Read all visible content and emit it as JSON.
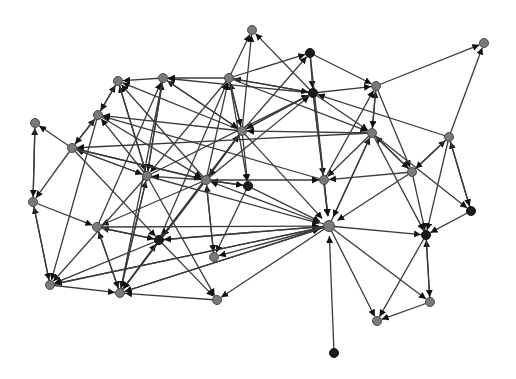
{
  "diagram": {
    "type": "directed-network-graph",
    "colors": {
      "edge": "#3a3a3a",
      "arrowhead": "#111111",
      "node_gray": "#7a7a7a",
      "node_dark": "#1c1c1c",
      "background": "#ffffff"
    },
    "nodes": [
      {
        "id": "n1",
        "x": 252,
        "y": 30,
        "kind": "gray"
      },
      {
        "id": "n2",
        "x": 484,
        "y": 43,
        "kind": "gray"
      },
      {
        "id": "n3",
        "x": 310,
        "y": 53,
        "kind": "dark"
      },
      {
        "id": "n4",
        "x": 118,
        "y": 81,
        "kind": "gray"
      },
      {
        "id": "n5",
        "x": 163,
        "y": 78,
        "kind": "gray"
      },
      {
        "id": "n6",
        "x": 229,
        "y": 78,
        "kind": "gray"
      },
      {
        "id": "n7",
        "x": 376,
        "y": 86,
        "kind": "gray"
      },
      {
        "id": "n8",
        "x": 313,
        "y": 93,
        "kind": "dark"
      },
      {
        "id": "n9",
        "x": 35,
        "y": 123,
        "kind": "gray"
      },
      {
        "id": "n10",
        "x": 98,
        "y": 115,
        "kind": "gray"
      },
      {
        "id": "n11",
        "x": 72,
        "y": 148,
        "kind": "gray"
      },
      {
        "id": "n12",
        "x": 242,
        "y": 131,
        "kind": "gray"
      },
      {
        "id": "n13",
        "x": 372,
        "y": 133,
        "kind": "gray"
      },
      {
        "id": "n14",
        "x": 449,
        "y": 137,
        "kind": "gray"
      },
      {
        "id": "n15",
        "x": 147,
        "y": 176,
        "kind": "gray"
      },
      {
        "id": "n16",
        "x": 206,
        "y": 180,
        "kind": "gray"
      },
      {
        "id": "n17",
        "x": 248,
        "y": 186,
        "kind": "dark"
      },
      {
        "id": "n18",
        "x": 324,
        "y": 180,
        "kind": "gray"
      },
      {
        "id": "n19",
        "x": 412,
        "y": 172,
        "kind": "gray"
      },
      {
        "id": "n20",
        "x": 33,
        "y": 202,
        "kind": "gray"
      },
      {
        "id": "n21",
        "x": 471,
        "y": 211,
        "kind": "dark"
      },
      {
        "id": "n22",
        "x": 97,
        "y": 227,
        "kind": "gray"
      },
      {
        "id": "n23",
        "x": 329,
        "y": 226,
        "kind": "gray",
        "hub": true
      },
      {
        "id": "n24",
        "x": 426,
        "y": 235,
        "kind": "dark"
      },
      {
        "id": "n25",
        "x": 159,
        "y": 240,
        "kind": "dark"
      },
      {
        "id": "n26",
        "x": 214,
        "y": 257,
        "kind": "gray"
      },
      {
        "id": "n27",
        "x": 50,
        "y": 285,
        "kind": "gray"
      },
      {
        "id": "n28",
        "x": 120,
        "y": 293,
        "kind": "gray"
      },
      {
        "id": "n29",
        "x": 217,
        "y": 300,
        "kind": "gray"
      },
      {
        "id": "n30",
        "x": 430,
        "y": 302,
        "kind": "gray"
      },
      {
        "id": "n31",
        "x": 377,
        "y": 321,
        "kind": "gray"
      },
      {
        "id": "n32",
        "x": 334,
        "y": 353,
        "kind": "dark"
      }
    ],
    "edges": [
      [
        "n6",
        "n1"
      ],
      [
        "n8",
        "n1"
      ],
      [
        "n12",
        "n1"
      ],
      [
        "n7",
        "n2"
      ],
      [
        "n14",
        "n2"
      ],
      [
        "n6",
        "n3"
      ],
      [
        "n12",
        "n3"
      ],
      [
        "n3",
        "n7"
      ],
      [
        "n3",
        "n8"
      ],
      [
        "n10",
        "n4"
      ],
      [
        "n5",
        "n4"
      ],
      [
        "n15",
        "n4"
      ],
      [
        "n16",
        "n4"
      ],
      [
        "n12",
        "n4"
      ],
      [
        "n6",
        "n5"
      ],
      [
        "n8",
        "n5"
      ],
      [
        "n15",
        "n5"
      ],
      [
        "n22",
        "n5"
      ],
      [
        "n12",
        "n5"
      ],
      [
        "n12",
        "n6"
      ],
      [
        "n16",
        "n6"
      ],
      [
        "n8",
        "n6"
      ],
      [
        "n25",
        "n6"
      ],
      [
        "n13",
        "n7"
      ],
      [
        "n8",
        "n7"
      ],
      [
        "n18",
        "n7"
      ],
      [
        "n6",
        "n8"
      ],
      [
        "n15",
        "n8"
      ],
      [
        "n16",
        "n8"
      ],
      [
        "n12",
        "n8"
      ],
      [
        "n14",
        "n8"
      ],
      [
        "n20",
        "n9"
      ],
      [
        "n11",
        "n9"
      ],
      [
        "n4",
        "n10"
      ],
      [
        "n11",
        "n10"
      ],
      [
        "n15",
        "n10"
      ],
      [
        "n12",
        "n10"
      ],
      [
        "n18",
        "n10"
      ],
      [
        "n10",
        "n11"
      ],
      [
        "n16",
        "n11"
      ],
      [
        "n13",
        "n11"
      ],
      [
        "n15",
        "n11"
      ],
      [
        "n8",
        "n12"
      ],
      [
        "n13",
        "n12"
      ],
      [
        "n6",
        "n12"
      ],
      [
        "n16",
        "n12"
      ],
      [
        "n5",
        "n12"
      ],
      [
        "n7",
        "n13"
      ],
      [
        "n8",
        "n13"
      ],
      [
        "n19",
        "n13"
      ],
      [
        "n23",
        "n13"
      ],
      [
        "n6",
        "n13"
      ],
      [
        "n19",
        "n14"
      ],
      [
        "n21",
        "n14"
      ],
      [
        "n5",
        "n15"
      ],
      [
        "n4",
        "n15"
      ],
      [
        "n11",
        "n15"
      ],
      [
        "n16",
        "n15"
      ],
      [
        "n28",
        "n15"
      ],
      [
        "n6",
        "n15"
      ],
      [
        "n11",
        "n16"
      ],
      [
        "n10",
        "n16"
      ],
      [
        "n12",
        "n16"
      ],
      [
        "n23",
        "n16"
      ],
      [
        "n26",
        "n16"
      ],
      [
        "n17",
        "n16"
      ],
      [
        "n12",
        "n17"
      ],
      [
        "n16",
        "n17"
      ],
      [
        "n6",
        "n17"
      ],
      [
        "n13",
        "n18"
      ],
      [
        "n8",
        "n18"
      ],
      [
        "n16",
        "n18"
      ],
      [
        "n19",
        "n18"
      ],
      [
        "n13",
        "n19"
      ],
      [
        "n7",
        "n19"
      ],
      [
        "n14",
        "n19"
      ],
      [
        "n9",
        "n20"
      ],
      [
        "n11",
        "n20"
      ],
      [
        "n27",
        "n20"
      ],
      [
        "n14",
        "n21"
      ],
      [
        "n13",
        "n21"
      ],
      [
        "n20",
        "n22"
      ],
      [
        "n25",
        "n22"
      ],
      [
        "n28",
        "n22"
      ],
      [
        "n16",
        "n22"
      ],
      [
        "n12",
        "n23"
      ],
      [
        "n15",
        "n23"
      ],
      [
        "n25",
        "n23"
      ],
      [
        "n22",
        "n23"
      ],
      [
        "n18",
        "n23"
      ],
      [
        "n8",
        "n23"
      ],
      [
        "n19",
        "n23"
      ],
      [
        "n13",
        "n23"
      ],
      [
        "n27",
        "n23"
      ],
      [
        "n17",
        "n23"
      ],
      [
        "n28",
        "n23"
      ],
      [
        "n3",
        "n23"
      ],
      [
        "n13",
        "n24"
      ],
      [
        "n23",
        "n24"
      ],
      [
        "n21",
        "n24"
      ],
      [
        "n19",
        "n24"
      ],
      [
        "n30",
        "n24"
      ],
      [
        "n14",
        "n24"
      ],
      [
        "n11",
        "n25"
      ],
      [
        "n22",
        "n25"
      ],
      [
        "n28",
        "n25"
      ],
      [
        "n16",
        "n25"
      ],
      [
        "n23",
        "n25"
      ],
      [
        "n12",
        "n25"
      ],
      [
        "n17",
        "n26"
      ],
      [
        "n16",
        "n26"
      ],
      [
        "n23",
        "n26"
      ],
      [
        "n20",
        "n27"
      ],
      [
        "n10",
        "n27"
      ],
      [
        "n15",
        "n27"
      ],
      [
        "n25",
        "n27"
      ],
      [
        "n23",
        "n27"
      ],
      [
        "n27",
        "n28"
      ],
      [
        "n22",
        "n28"
      ],
      [
        "n15",
        "n28"
      ],
      [
        "n16",
        "n28"
      ],
      [
        "n5",
        "n28"
      ],
      [
        "n29",
        "n28"
      ],
      [
        "n23",
        "n28"
      ],
      [
        "n12",
        "n28"
      ],
      [
        "n23",
        "n29"
      ],
      [
        "n25",
        "n29"
      ],
      [
        "n15",
        "n29"
      ],
      [
        "n24",
        "n30"
      ],
      [
        "n23",
        "n30"
      ],
      [
        "n23",
        "n31"
      ],
      [
        "n24",
        "n31"
      ],
      [
        "n30",
        "n31"
      ],
      [
        "n32",
        "n23"
      ]
    ]
  }
}
